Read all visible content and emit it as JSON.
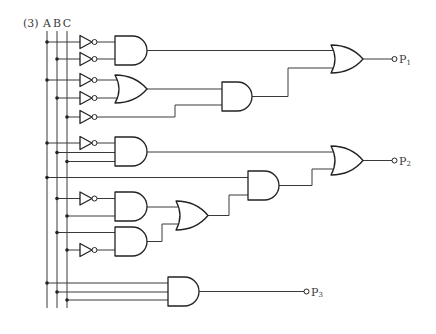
{
  "problem": {
    "number_label": "(3)"
  },
  "inputs": [
    {
      "label": "A"
    },
    {
      "label": "B"
    },
    {
      "label": "C"
    }
  ],
  "outputs": [
    {
      "label": "P",
      "subscript": "1"
    },
    {
      "label": "P",
      "subscript": "2"
    },
    {
      "label": "P",
      "subscript": "3"
    }
  ],
  "circuit": {
    "expressions": {
      "P1": "OR( AND(NOT A, NOT B), AND( OR(NOT A, NOT B), NOT C ) )",
      "P2": "OR( AND(NOT A, B, C), AND( A, OR( AND(NOT B, C), AND(B, NOT C) ) ) )",
      "P3": "AND(A, B, C)"
    },
    "gates": [
      {
        "id": "not-1",
        "type": "NOT",
        "inputs": [
          "A"
        ]
      },
      {
        "id": "not-2",
        "type": "NOT",
        "inputs": [
          "B"
        ]
      },
      {
        "id": "and-1",
        "type": "AND",
        "inputs": [
          "not-1",
          "not-2"
        ]
      },
      {
        "id": "not-3",
        "type": "NOT",
        "inputs": [
          "A"
        ]
      },
      {
        "id": "not-4",
        "type": "NOT",
        "inputs": [
          "B"
        ]
      },
      {
        "id": "or-1",
        "type": "OR",
        "inputs": [
          "not-3",
          "not-4"
        ]
      },
      {
        "id": "not-5",
        "type": "NOT",
        "inputs": [
          "C"
        ]
      },
      {
        "id": "and-2",
        "type": "AND",
        "inputs": [
          "or-1",
          "not-5"
        ]
      },
      {
        "id": "or-p1",
        "type": "OR",
        "inputs": [
          "and-1",
          "and-2"
        ],
        "output": "P1"
      },
      {
        "id": "not-6",
        "type": "NOT",
        "inputs": [
          "A"
        ]
      },
      {
        "id": "and-3",
        "type": "AND",
        "inputs": [
          "not-6",
          "B",
          "C"
        ]
      },
      {
        "id": "not-7",
        "type": "NOT",
        "inputs": [
          "B"
        ]
      },
      {
        "id": "and-4",
        "type": "AND",
        "inputs": [
          "not-7",
          "C"
        ]
      },
      {
        "id": "not-8",
        "type": "NOT",
        "inputs": [
          "C"
        ]
      },
      {
        "id": "and-5",
        "type": "AND",
        "inputs": [
          "B",
          "not-8"
        ]
      },
      {
        "id": "or-3",
        "type": "OR",
        "inputs": [
          "and-4",
          "and-5"
        ]
      },
      {
        "id": "and-6",
        "type": "AND",
        "inputs": [
          "A",
          "or-3"
        ]
      },
      {
        "id": "or-p2",
        "type": "OR",
        "inputs": [
          "and-3",
          "and-6"
        ],
        "output": "P2"
      },
      {
        "id": "and-7",
        "type": "AND",
        "inputs": [
          "A",
          "B",
          "C"
        ],
        "output": "P3"
      }
    ]
  },
  "colors": {
    "background": "#ffffff",
    "wire": "#3a3a3a",
    "gate_stroke": "#222222",
    "text": "#3a3a3a"
  }
}
